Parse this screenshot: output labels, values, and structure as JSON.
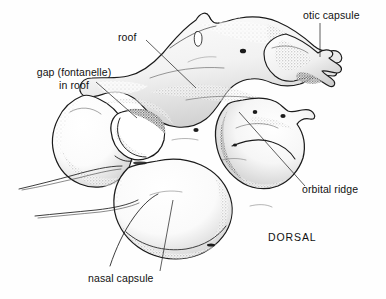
{
  "figure": {
    "view_label": "DORSAL",
    "background_color": "#fefefe",
    "ink_color": "#1a1a1a"
  },
  "labels": {
    "otic_capsule": "otic capsule",
    "roof": "roof",
    "gap_line1": "gap (fontanelle)",
    "gap_line2": "in roof",
    "orbital_ridge": "orbital ridge",
    "nasal_capsule": "nasal capsule",
    "dorsal": "DORSAL"
  },
  "structures": [
    {
      "name": "otic capsule",
      "position": "upper right",
      "leader": "vertical"
    },
    {
      "name": "roof",
      "position": "upper center",
      "leader": "diagonal down-right"
    },
    {
      "name": "gap (fontanelle) in roof",
      "position": "left of center",
      "leader": "diagonal down-right"
    },
    {
      "name": "orbital ridge",
      "position": "right center",
      "leader": "diagonal up-left"
    },
    {
      "name": "nasal capsule",
      "position": "lower center",
      "leader": "near vertical"
    }
  ]
}
